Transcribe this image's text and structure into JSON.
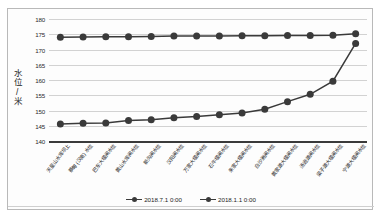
{
  "chart_data": {
    "type": "line",
    "title": "",
    "xlabel": "",
    "ylabel": "水位/米",
    "ylim": [
      140,
      180
    ],
    "yticks": [
      140,
      145,
      150,
      155,
      160,
      165,
      170,
      175,
      180
    ],
    "grid": true,
    "legend_position": "bottom",
    "categories": [
      "天星山水库坝上",
      "蔡甸 (汉南) 水位",
      "巴东大堰闸水位",
      "黄山水库闸水位",
      "新沟闸水位",
      "汉阳闸水位",
      "万家大堰闸水位",
      "石牛堰闸水位",
      "朱家大堰闸水位",
      "白沙洲闸水位",
      "黄家湖大堰闸水位",
      "汤逊湖闸水位",
      "梁子湖大堰闸水位",
      "宁湖大堰闸水位"
    ],
    "series": [
      {
        "name": "2018.7.1 0:00",
        "values": [
          174.0,
          174.1,
          174.2,
          174.2,
          174.3,
          174.4,
          174.4,
          174.4,
          174.5,
          174.5,
          174.6,
          174.6,
          174.7,
          175.2
        ]
      },
      {
        "name": "2018.1.1 0:00",
        "values": [
          145.6,
          145.8,
          145.9,
          146.7,
          147.0,
          147.6,
          148.0,
          148.6,
          149.2,
          150.4,
          152.9,
          155.3,
          159.6,
          172.0
        ]
      }
    ]
  },
  "legend": {
    "items": [
      {
        "label": "2018.7.1 0:00",
        "color": "#3a3a3a"
      },
      {
        "label": "2018.1.1 0:00",
        "color": "#3a3a3a"
      }
    ]
  },
  "colors": {
    "series_1": "#3a3a3a",
    "series_2": "#3a3a3a",
    "gridline": "#d2d2d2",
    "axis": "#3a3a3a",
    "frame_border": "#b9b9b9",
    "background": "#fdfdfd"
  }
}
